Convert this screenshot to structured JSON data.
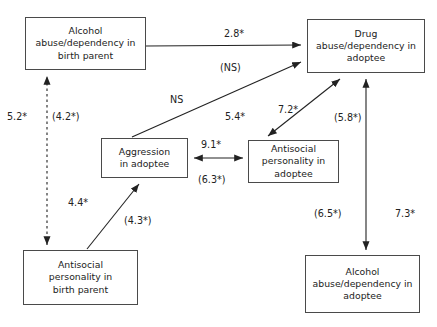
{
  "diagram": {
    "type": "path-model",
    "nodes": [
      {
        "id": "alcohol-birth-parent",
        "label": "Alcohol\nabuse/dependency in\nbirth parent",
        "x": 25,
        "y": 17,
        "w": 121,
        "h": 53
      },
      {
        "id": "drug-adoptee",
        "label": "Drug\nabuse/dependency in\nadoptee",
        "x": 307,
        "y": 19,
        "w": 118,
        "h": 54
      },
      {
        "id": "aggression-adoptee",
        "label": "Aggression\nin adoptee",
        "x": 101,
        "y": 138,
        "w": 87,
        "h": 40
      },
      {
        "id": "antisocial-adoptee",
        "label": "Antisocial\npersonality in\nadoptee",
        "x": 248,
        "y": 140,
        "w": 91,
        "h": 43
      },
      {
        "id": "antisocial-birth-parent",
        "label": "Antisocial\npersonality in\nbirth parent",
        "x": 23,
        "y": 250,
        "w": 115,
        "h": 55
      },
      {
        "id": "alcohol-adoptee",
        "label": "Alcohol\nabuse/dependency in\nadoptee",
        "x": 305,
        "y": 255,
        "w": 115,
        "h": 58
      }
    ],
    "edges": [
      {
        "id": "alcohol-bp-to-drug-adoptee",
        "from": "alcohol-birth-parent",
        "to": "drug-adoptee",
        "style": "solid",
        "heads": "single",
        "labels": [
          "2.8*",
          "(NS)"
        ]
      },
      {
        "id": "aggression-to-drug-adoptee",
        "from": "aggression-adoptee",
        "to": "drug-adoptee",
        "style": "solid",
        "heads": "single",
        "labels": [
          "NS",
          "5.4*"
        ]
      },
      {
        "id": "antisocial-adoptee-to-drug-adoptee",
        "from": "antisocial-adoptee",
        "to": "drug-adoptee",
        "style": "solid",
        "heads": "double",
        "labels": [
          "7.2*",
          "(5.8*)"
        ]
      },
      {
        "id": "aggression-antisocial-adoptee",
        "from": "aggression-adoptee",
        "to": "antisocial-adoptee",
        "style": "solid",
        "heads": "double",
        "labels": [
          "9.1*",
          "(6.3*)"
        ]
      },
      {
        "id": "alcohol-bp-antisocial-bp",
        "from": "antisocial-birth-parent",
        "to": "alcohol-birth-parent",
        "style": "dashed",
        "heads": "double",
        "labels": [
          "5.2*",
          "(4.2*)"
        ]
      },
      {
        "id": "antisocial-bp-to-aggression",
        "from": "antisocial-birth-parent",
        "to": "aggression-adoptee",
        "style": "solid",
        "heads": "single",
        "labels": [
          "4.4*",
          "(4.3*)"
        ]
      },
      {
        "id": "drug-adoptee-alcohol-adoptee",
        "from": "drug-adoptee",
        "to": "alcohol-adoptee",
        "style": "solid",
        "heads": "double",
        "labels": [
          "(6.5*)",
          "7.3*"
        ]
      }
    ],
    "edge_labels": [
      {
        "id": "label-2-8",
        "text": "2.8*",
        "x": 224,
        "y": 28
      },
      {
        "id": "label-ns-p",
        "text": "(NS)",
        "x": 220,
        "y": 62
      },
      {
        "id": "label-ns",
        "text": "NS",
        "x": 170,
        "y": 94
      },
      {
        "id": "label-5-4",
        "text": "5.4*",
        "x": 225,
        "y": 111
      },
      {
        "id": "label-7-2",
        "text": "7.2*",
        "x": 278,
        "y": 104
      },
      {
        "id": "label-5-8",
        "text": "(5.8*)",
        "x": 334,
        "y": 112
      },
      {
        "id": "label-9-1",
        "text": "9.1*",
        "x": 201,
        "y": 139
      },
      {
        "id": "label-6-3",
        "text": "(6.3*)",
        "x": 198,
        "y": 174
      },
      {
        "id": "label-5-2",
        "text": "5.2*",
        "x": 7,
        "y": 111
      },
      {
        "id": "label-4-2",
        "text": "(4.2*)",
        "x": 52,
        "y": 111
      },
      {
        "id": "label-4-4",
        "text": "4.4*",
        "x": 68,
        "y": 197
      },
      {
        "id": "label-4-3",
        "text": "(4.3*)",
        "x": 124,
        "y": 215
      },
      {
        "id": "label-6-5",
        "text": "(6.5*)",
        "x": 314,
        "y": 208
      },
      {
        "id": "label-7-3",
        "text": "7.3*",
        "x": 395,
        "y": 208
      }
    ],
    "colors": {
      "line": "#222222",
      "node_border": "#4a4a4a",
      "background": "#ffffff",
      "text": "#222222"
    }
  }
}
